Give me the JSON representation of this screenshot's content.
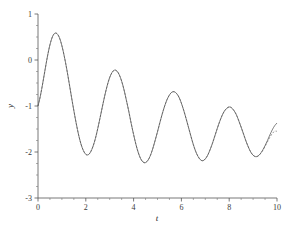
{
  "chart_data": {
    "type": "line",
    "title": "",
    "subtitle": "",
    "xlabel": "t",
    "ylabel": "y",
    "xlim": [
      0,
      10
    ],
    "ylim": [
      -3,
      1
    ],
    "grid": false,
    "legend_position": "none",
    "x_ticks": [
      0,
      2,
      4,
      6,
      8,
      10
    ],
    "x_tick_labels": [
      "0",
      "2",
      "4",
      "6",
      "8",
      "10"
    ],
    "x_minor_tick_step": 0.5,
    "y_ticks": [
      1,
      0,
      -1,
      -2,
      -3
    ],
    "y_tick_labels": [
      "1",
      "0",
      "-1",
      "-2",
      "-3"
    ],
    "y_minor_tick_step": 0.25,
    "annotations": [],
    "series": [
      {
        "name": "solid-curve",
        "style": "solid",
        "color": "#4a4a4a",
        "description": "damped oscillation, period about 2.05, starting at y = -1 at t = 0",
        "x": [
          0.0,
          0.1,
          0.2,
          0.3,
          0.4,
          0.5,
          0.6,
          0.7,
          0.8,
          0.9,
          1.0,
          1.1,
          1.2,
          1.3,
          1.4,
          1.5,
          1.6,
          1.7,
          1.8,
          1.9,
          2.0,
          2.1,
          2.2,
          2.3,
          2.4,
          2.5,
          2.6,
          2.7,
          2.8,
          2.9,
          3.0,
          3.1,
          3.2,
          3.3,
          3.4,
          3.5,
          3.6,
          3.7,
          3.8,
          3.9,
          4.0,
          4.1,
          4.2,
          4.3,
          4.4,
          4.5,
          4.6,
          4.7,
          4.8,
          4.9,
          5.0,
          5.1,
          5.2,
          5.3,
          5.4,
          5.5,
          5.6,
          5.7,
          5.8,
          5.9,
          6.0,
          6.1,
          6.2,
          6.3,
          6.4,
          6.5,
          6.6,
          6.7,
          6.8,
          6.9,
          7.0,
          7.1,
          7.2,
          7.3,
          7.4,
          7.5,
          7.6,
          7.7,
          7.8,
          7.9,
          8.0,
          8.1,
          8.2,
          8.3,
          8.4,
          8.5,
          8.6,
          8.7,
          8.8,
          8.9,
          9.0,
          9.1,
          9.2,
          9.3,
          9.4,
          9.5,
          9.6,
          9.7,
          9.8,
          9.9,
          10.0
        ],
        "y": [
          -1.0,
          -0.78,
          -0.5,
          -0.2,
          0.09,
          0.33,
          0.5,
          0.58,
          0.57,
          0.48,
          0.31,
          0.08,
          -0.19,
          -0.49,
          -0.8,
          -1.1,
          -1.38,
          -1.63,
          -1.83,
          -1.97,
          -2.05,
          -2.06,
          -2.0,
          -1.88,
          -1.71,
          -1.49,
          -1.25,
          -1.0,
          -0.76,
          -0.55,
          -0.38,
          -0.27,
          -0.22,
          -0.24,
          -0.32,
          -0.46,
          -0.65,
          -0.88,
          -1.12,
          -1.38,
          -1.62,
          -1.84,
          -2.02,
          -2.15,
          -2.22,
          -2.23,
          -2.18,
          -2.08,
          -1.93,
          -1.75,
          -1.56,
          -1.36,
          -1.17,
          -1.0,
          -0.86,
          -0.76,
          -0.7,
          -0.69,
          -0.73,
          -0.81,
          -0.94,
          -1.1,
          -1.28,
          -1.47,
          -1.66,
          -1.84,
          -1.99,
          -2.1,
          -2.17,
          -2.19,
          -2.15,
          -2.07,
          -1.95,
          -1.81,
          -1.65,
          -1.49,
          -1.34,
          -1.21,
          -1.11,
          -1.05,
          -1.02,
          -1.04,
          -1.1,
          -1.19,
          -1.32,
          -1.46,
          -1.61,
          -1.76,
          -1.89,
          -2.0,
          -2.07,
          -2.1,
          -2.09,
          -2.04,
          -1.96,
          -1.86,
          -1.75,
          -1.63,
          -1.52,
          -1.43,
          -1.37
        ]
      },
      {
        "name": "dashed-curve",
        "style": "dashed",
        "color": "#6e6e6e",
        "description": "nearly identical comparison curve, slightly offset, diverging near t = 10",
        "x": [
          0.0,
          0.1,
          0.2,
          0.3,
          0.4,
          0.5,
          0.6,
          0.7,
          0.8,
          0.9,
          1.0,
          1.1,
          1.2,
          1.3,
          1.4,
          1.5,
          1.6,
          1.7,
          1.8,
          1.9,
          2.0,
          2.1,
          2.2,
          2.3,
          2.4,
          2.5,
          2.6,
          2.7,
          2.8,
          2.9,
          3.0,
          3.1,
          3.2,
          3.3,
          3.4,
          3.5,
          3.6,
          3.7,
          3.8,
          3.9,
          4.0,
          4.1,
          4.2,
          4.3,
          4.4,
          4.5,
          4.6,
          4.7,
          4.8,
          4.9,
          5.0,
          5.1,
          5.2,
          5.3,
          5.4,
          5.5,
          5.6,
          5.7,
          5.8,
          5.9,
          6.0,
          6.1,
          6.2,
          6.3,
          6.4,
          6.5,
          6.6,
          6.7,
          6.8,
          6.9,
          7.0,
          7.1,
          7.2,
          7.3,
          7.4,
          7.5,
          7.6,
          7.7,
          7.8,
          7.9,
          8.0,
          8.1,
          8.2,
          8.3,
          8.4,
          8.5,
          8.6,
          8.7,
          8.8,
          8.9,
          9.0,
          9.1,
          9.2,
          9.3,
          9.4,
          9.5,
          9.6,
          9.7,
          9.8,
          9.9,
          10.0
        ],
        "y": [
          -1.0,
          -0.78,
          -0.5,
          -0.2,
          0.09,
          0.33,
          0.5,
          0.58,
          0.57,
          0.48,
          0.31,
          0.08,
          -0.19,
          -0.49,
          -0.8,
          -1.1,
          -1.38,
          -1.63,
          -1.83,
          -1.97,
          -2.05,
          -2.06,
          -2.0,
          -1.88,
          -1.71,
          -1.49,
          -1.25,
          -1.0,
          -0.76,
          -0.55,
          -0.38,
          -0.27,
          -0.22,
          -0.24,
          -0.32,
          -0.46,
          -0.65,
          -0.88,
          -1.12,
          -1.38,
          -1.62,
          -1.84,
          -2.02,
          -2.15,
          -2.22,
          -2.23,
          -2.18,
          -2.08,
          -1.93,
          -1.75,
          -1.56,
          -1.36,
          -1.17,
          -1.0,
          -0.86,
          -0.76,
          -0.7,
          -0.69,
          -0.73,
          -0.81,
          -0.94,
          -1.1,
          -1.28,
          -1.47,
          -1.66,
          -1.84,
          -1.99,
          -2.1,
          -2.17,
          -2.19,
          -2.15,
          -2.07,
          -1.95,
          -1.81,
          -1.65,
          -1.49,
          -1.34,
          -1.21,
          -1.11,
          -1.05,
          -1.02,
          -1.04,
          -1.1,
          -1.19,
          -1.32,
          -1.46,
          -1.61,
          -1.76,
          -1.89,
          -2.0,
          -2.07,
          -2.1,
          -2.09,
          -2.04,
          -1.97,
          -1.88,
          -1.78,
          -1.68,
          -1.6,
          -1.55,
          -1.55
        ]
      }
    ]
  }
}
